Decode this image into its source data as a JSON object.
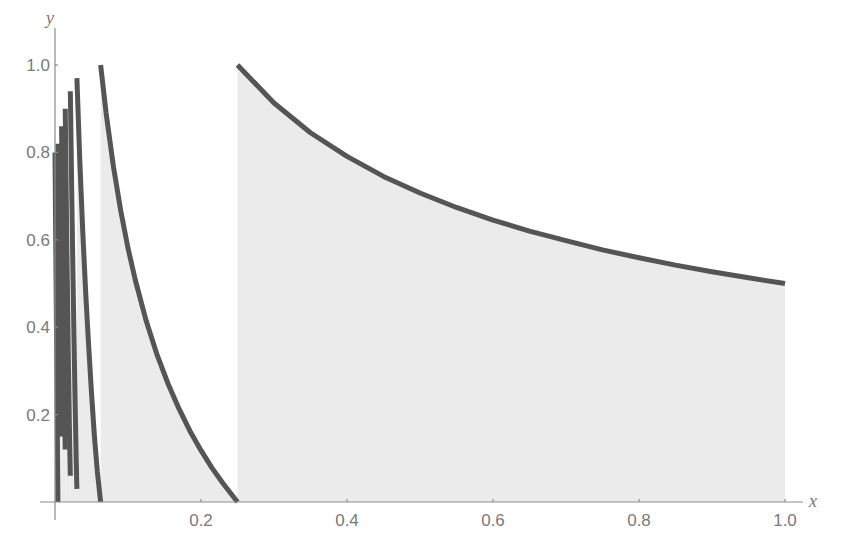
{
  "chart_data": {
    "type": "area",
    "title": "",
    "xlabel": "x",
    "ylabel": "y",
    "xlim": [
      0,
      1.0
    ],
    "ylim": [
      0,
      1.0
    ],
    "grid": false,
    "legend": null,
    "x_ticks": [
      "0.2",
      "0.4",
      "0.6",
      "0.8",
      "1.0"
    ],
    "x_tick_values": [
      0.2,
      0.4,
      0.6,
      0.8,
      1.0
    ],
    "y_ticks": [
      "0.2",
      "0.4",
      "0.6",
      "0.8",
      "1.0"
    ],
    "y_tick_values": [
      0.2,
      0.4,
      0.6,
      0.8,
      1.0
    ],
    "colors": {
      "line": "#555555",
      "fill": "#ebebeb",
      "axis": "#8c8c8c",
      "label": "#7a7a7a"
    },
    "series": [
      {
        "name": "segment-1",
        "interval": [
          0.25,
          1.0
        ],
        "x": [
          0.25,
          0.3,
          0.35,
          0.4,
          0.45,
          0.5,
          0.55,
          0.6,
          0.65,
          0.7,
          0.75,
          0.8,
          0.85,
          0.9,
          0.95,
          1.0
        ],
        "y": [
          1.0,
          0.913,
          0.845,
          0.791,
          0.745,
          0.707,
          0.674,
          0.645,
          0.62,
          0.598,
          0.577,
          0.559,
          0.542,
          0.527,
          0.513,
          0.5
        ]
      },
      {
        "name": "segment-2",
        "interval": [
          0.0625,
          0.25
        ],
        "x": [
          0.0625,
          0.07,
          0.08,
          0.09,
          0.1,
          0.11,
          0.125,
          0.14,
          0.155,
          0.17,
          0.185,
          0.2,
          0.215,
          0.23,
          0.25
        ],
        "y": [
          1.0,
          0.89,
          0.768,
          0.667,
          0.581,
          0.508,
          0.414,
          0.336,
          0.27,
          0.213,
          0.162,
          0.118,
          0.078,
          0.043,
          0.0
        ]
      },
      {
        "name": "segment-3",
        "interval": [
          0.03,
          0.0625
        ],
        "x": [
          0.03,
          0.034,
          0.038,
          0.042,
          0.046,
          0.05,
          0.054,
          0.058,
          0.0625
        ],
        "y": [
          0.97,
          0.78,
          0.62,
          0.48,
          0.36,
          0.25,
          0.15,
          0.07,
          0.0
        ]
      },
      {
        "name": "segment-4",
        "interval": [
          0.021,
          0.03
        ],
        "x": [
          0.021,
          0.023,
          0.025,
          0.027,
          0.029,
          0.03
        ],
        "y": [
          0.94,
          0.7,
          0.48,
          0.28,
          0.1,
          0.03
        ]
      },
      {
        "name": "segment-5",
        "interval": [
          0.014,
          0.021
        ],
        "x": [
          0.014,
          0.016,
          0.018,
          0.02,
          0.021
        ],
        "y": [
          0.9,
          0.62,
          0.36,
          0.14,
          0.06
        ]
      },
      {
        "name": "segment-6",
        "interval": [
          0.009,
          0.014
        ],
        "x": [
          0.009,
          0.011,
          0.013,
          0.014
        ],
        "y": [
          0.86,
          0.55,
          0.25,
          0.12
        ]
      },
      {
        "name": "segment-7",
        "interval": [
          0.004,
          0.009
        ],
        "x": [
          0.004,
          0.006,
          0.008,
          0.009
        ],
        "y": [
          0.82,
          0.55,
          0.28,
          0.15
        ]
      },
      {
        "name": "segment-8",
        "interval": [
          0.0,
          0.004
        ],
        "x": [
          0.0,
          0.002,
          0.004
        ],
        "y": [
          0.8,
          0.4,
          0.0
        ]
      }
    ]
  },
  "axes": {
    "x_name": "x",
    "y_name": "y"
  }
}
